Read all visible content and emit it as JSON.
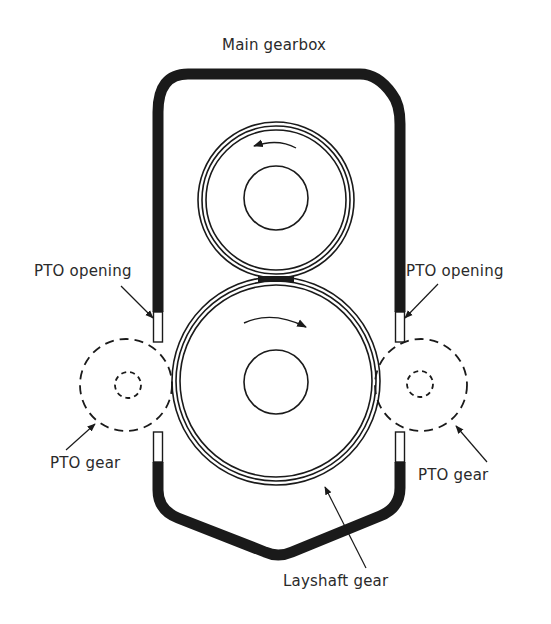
{
  "diagram": {
    "title": "Main gearbox",
    "labels": {
      "pto_opening_left": "PTO opening",
      "pto_opening_right": "PTO opening",
      "pto_gear_left": "PTO gear",
      "pto_gear_right": "PTO gear",
      "layshaft_gear": "Layshaft gear"
    },
    "components": [
      {
        "id": "main-gearbox-housing",
        "type": "housing"
      },
      {
        "id": "upper-gear",
        "type": "gear",
        "rotation": "counter-clockwise"
      },
      {
        "id": "layshaft-gear",
        "type": "gear",
        "rotation": "clockwise"
      },
      {
        "id": "pto-gear-left",
        "type": "gear",
        "style": "dashed"
      },
      {
        "id": "pto-gear-right",
        "type": "gear",
        "style": "dashed"
      },
      {
        "id": "pto-opening-left",
        "type": "opening"
      },
      {
        "id": "pto-opening-right",
        "type": "opening"
      }
    ],
    "colors": {
      "ink": "#1a1a1a",
      "background": "#ffffff"
    }
  }
}
